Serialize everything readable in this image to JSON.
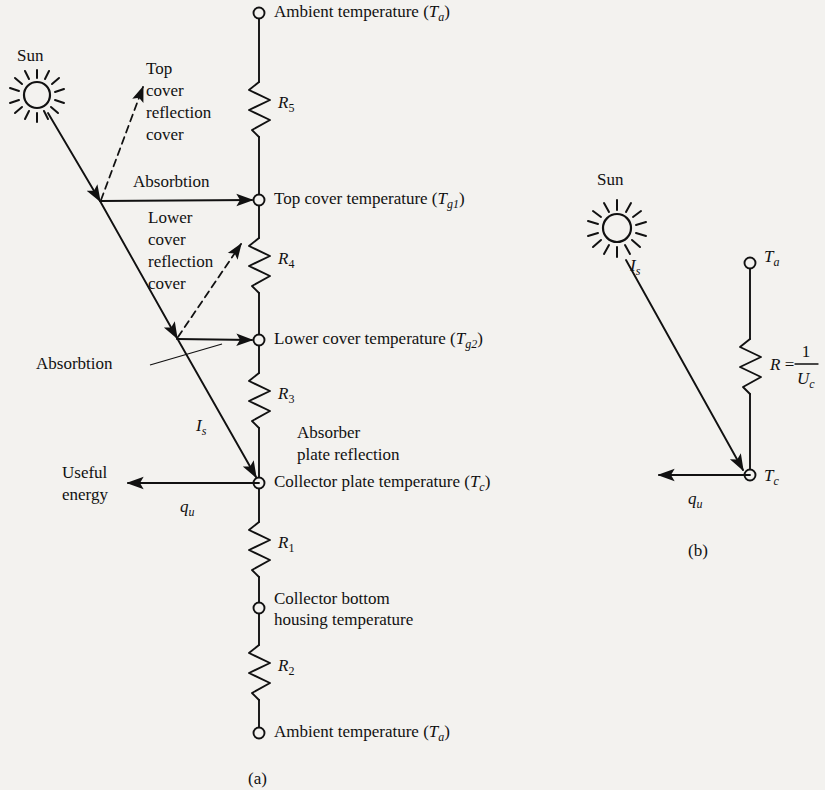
{
  "figure": {
    "background_color": "#f3f2ef",
    "ink_color": "#111111",
    "panel_a_caption": "(a)",
    "panel_b_caption": "(b)"
  },
  "panel_a": {
    "sun_label": "Sun",
    "nodes": [
      {
        "id": "ambient-top",
        "label": "Ambient temperature (",
        "symbol": "T",
        "subscript": "a",
        "label_close": ")",
        "x": 259,
        "y": 13
      },
      {
        "id": "top-cover",
        "label": "Top cover temperature (",
        "symbol": "T",
        "subscript": "g1",
        "label_close": ")",
        "x": 259,
        "y": 200
      },
      {
        "id": "lower-cover",
        "label": "Lower cover temperature (",
        "symbol": "T",
        "subscript": "g2",
        "label_close": ")",
        "x": 259,
        "y": 340
      },
      {
        "id": "collector-plate",
        "label": "Collector plate temperature  (",
        "symbol": "T",
        "subscript": "c",
        "label_close": ")",
        "x": 259,
        "y": 483
      },
      {
        "id": "collector-bottom",
        "label_line1": "Collector bottom",
        "label_line2": "housing temperature",
        "x": 259,
        "y": 608
      },
      {
        "id": "ambient-bottom",
        "label": "Ambient temperature (",
        "symbol": "T",
        "subscript": "a",
        "label_close": ")",
        "x": 259,
        "y": 733
      }
    ],
    "resistors": [
      {
        "id": "R5",
        "symbol": "R",
        "subscript": "5",
        "y_top": 82,
        "y_bottom": 137
      },
      {
        "id": "R4",
        "symbol": "R",
        "subscript": "4",
        "y_top": 238,
        "y_bottom": 293
      },
      {
        "id": "R3",
        "symbol": "R",
        "subscript": "3",
        "y_top": 373,
        "y_bottom": 428
      },
      {
        "id": "R1",
        "symbol": "R",
        "subscript": "1",
        "y_top": 522,
        "y_bottom": 577
      },
      {
        "id": "R2",
        "symbol": "R",
        "subscript": "2",
        "y_top": 645,
        "y_bottom": 700
      }
    ],
    "annotations": {
      "top_cover_reflection": [
        "Top",
        "cover",
        "reflection",
        "cover"
      ],
      "lower_cover_reflection": [
        "Lower",
        "cover",
        "reflection",
        "cover"
      ],
      "absorbtion_upper": "Absorbtion",
      "absorbtion_lower": "Absorbtion",
      "absorber_plate_reflection": [
        "Absorber",
        "plate reflection"
      ],
      "useful_energy": [
        "Useful",
        "energy"
      ],
      "incident_flux_symbol": "I",
      "incident_flux_subscript": "s",
      "useful_heat_symbol": "q",
      "useful_heat_subscript": "u"
    }
  },
  "panel_b": {
    "sun_label": "Sun",
    "incident_flux_symbol": "I",
    "incident_flux_subscript": "s",
    "useful_heat_symbol": "q",
    "useful_heat_subscript": "u",
    "node_ambient_symbol": "T",
    "node_ambient_subscript": "a",
    "node_collector_symbol": "T",
    "node_collector_subscript": "c",
    "resistor_symbol": "R",
    "resistor_equals": "=",
    "resistor_numerator": "1",
    "resistor_denominator_symbol": "U",
    "resistor_denominator_subscript": "c"
  }
}
